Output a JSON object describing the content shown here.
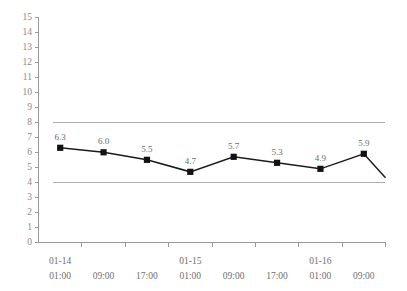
{
  "chart_data": {
    "type": "line",
    "title": "",
    "xlabel": "",
    "ylabel": "",
    "ylim": [
      0,
      15
    ],
    "ytick_step": 1,
    "grid": false,
    "legend": "none",
    "categories": [
      "01:00",
      "09:00",
      "17:00",
      "01:00",
      "09:00",
      "17:00",
      "01:00",
      "09:00"
    ],
    "category_dates": [
      "01-14",
      "",
      "",
      "01-15",
      "",
      "",
      "01-16",
      ""
    ],
    "values": [
      6.3,
      6.0,
      5.5,
      4.7,
      5.7,
      5.3,
      4.9,
      5.9
    ],
    "point_labels": [
      "6.3",
      "6.0",
      "5.5",
      "4.7",
      "5.7",
      "5.3",
      "4.9",
      "5.9"
    ],
    "ytick_labels": [
      "15",
      "14",
      "13",
      "12",
      "11",
      "10",
      "9",
      "8",
      "7",
      "6",
      "5",
      "4",
      "3",
      "2",
      "1",
      "0"
    ],
    "reference_lines": [
      {
        "value": 8,
        "name": "upper-reference-line"
      },
      {
        "value": 4,
        "name": "lower-reference-line"
      }
    ],
    "trailing_segment": {
      "end_value": 4.3,
      "labeled": false
    },
    "colors": {
      "series": "#121212",
      "marker": "#121212",
      "reference_line": "#aeaeae",
      "axis": "#9a9a9a",
      "tick_text": "#6f6f6f",
      "data_label": "#6b6b6b",
      "background": "#ffffff"
    }
  }
}
